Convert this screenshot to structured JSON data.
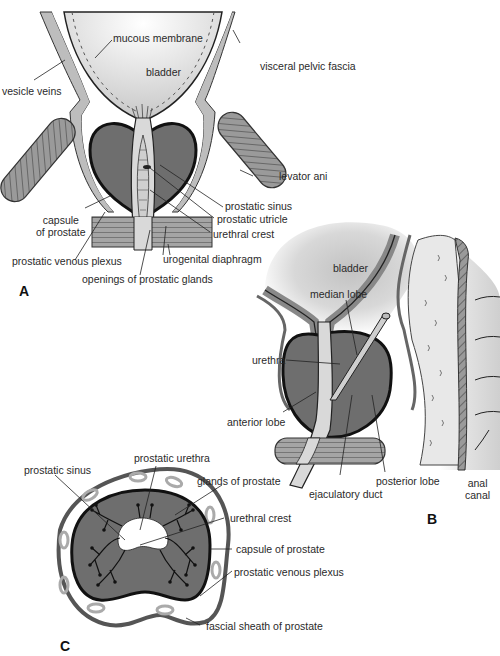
{
  "figure": {
    "colors": {
      "prostate": "#6e6e6e",
      "bladder_light": "#e6e6e6",
      "bladder_dark": "#b0b0b0",
      "tissue": "#9a9a9a",
      "outline": "#111111",
      "background": "#ffffff"
    },
    "panels": {
      "A": {
        "id": "A",
        "labels": {
          "mucous_membrane": "mucous membrane",
          "bladder": "bladder",
          "visceral_pelvic_fascia": "visceral pelvic fascia",
          "vesicle_veins": "vesicle veins",
          "levator_ani": "levator ani",
          "prostatic_sinus": "prostatic sinus",
          "prostatic_utricle": "prostatic utricle",
          "capsule_of_prostate_1": "capsule",
          "capsule_of_prostate_2": "of prostate",
          "urethral_crest": "urethral crest",
          "prostatic_venous_plexus": "prostatic venous plexus",
          "urogenital_diaphragm": "urogenital diaphragm",
          "openings_of_prostatic_glands": "openings of prostatic glands"
        }
      },
      "B": {
        "id": "B",
        "labels": {
          "bladder": "bladder",
          "median_lobe": "median lobe",
          "urethra": "urethra",
          "anterior_lobe": "anterior lobe",
          "posterior_lobe": "posterior lobe",
          "ejaculatory_duct": "ejaculatory duct",
          "anal_canal_1": "anal",
          "anal_canal_2": "canal"
        }
      },
      "C": {
        "id": "C",
        "labels": {
          "prostatic_sinus": "prostatic sinus",
          "prostatic_urethra": "prostatic urethra",
          "glands_of_prostate": "glands of prostate",
          "urethral_crest": "urethral crest",
          "capsule_of_prostate": "capsule of prostate",
          "prostatic_venous_plexus": "prostatic venous plexus",
          "fascial_sheath_of_prostate": "fascial sheath of prostate"
        }
      }
    }
  }
}
